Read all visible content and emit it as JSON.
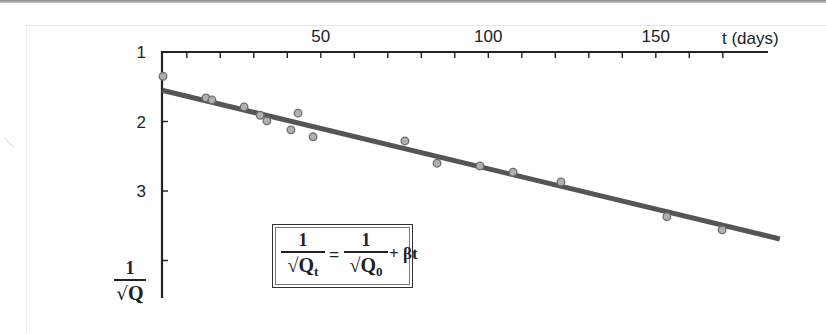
{
  "chart_data": {
    "type": "scatter",
    "title": "",
    "xlabel": "t (days)",
    "ylabel": "1/√Q",
    "x_axis": {
      "position": "top",
      "range": [
        0,
        185
      ],
      "ticks": [
        10,
        20,
        30,
        40,
        50,
        60,
        70,
        80,
        90,
        100,
        110,
        120,
        130,
        140,
        150,
        160,
        170
      ],
      "tick_labels": [
        {
          "value": 50,
          "label": "50"
        },
        {
          "value": 100,
          "label": "100"
        },
        {
          "value": 150,
          "label": "150"
        }
      ]
    },
    "y_axis": {
      "inverted": true,
      "range": [
        1,
        4.2
      ],
      "ticks": [
        1,
        2,
        3,
        4
      ],
      "tick_labels": [
        {
          "value": 1,
          "label": "1"
        },
        {
          "value": 2,
          "label": "2"
        },
        {
          "value": 3,
          "label": "3"
        }
      ]
    },
    "grid": false,
    "legend": null,
    "series": [
      {
        "name": "measurements",
        "kind": "points",
        "x": [
          2.9,
          15.7,
          17.5,
          27.1,
          31.9,
          33.9,
          41.1,
          43.2,
          47.7,
          75.1,
          84.7,
          97.5,
          107.4,
          121.7,
          153.3,
          169.8
        ],
        "y": [
          1.35,
          1.66,
          1.69,
          1.79,
          1.91,
          1.99,
          2.12,
          1.88,
          2.22,
          2.28,
          2.6,
          2.64,
          2.73,
          2.87,
          3.37,
          3.56
        ]
      },
      {
        "name": "linear fit",
        "kind": "line",
        "x": [
          2.6,
          187
        ],
        "y": [
          1.55,
          3.69
        ]
      }
    ],
    "annotations": [
      {
        "text": "1/√Qt = 1/√Q0 + βt",
        "position": "lower-left box"
      }
    ]
  },
  "labels": {
    "x_title": "t (days)",
    "x_ticks": [
      "50",
      "100",
      "150"
    ],
    "y_ticks": [
      "1",
      "2",
      "3"
    ],
    "y_title_num": "1",
    "y_title_den": "Q",
    "formula": {
      "lhs_num": "1",
      "lhs_den": "Q",
      "lhs_sub": "t",
      "eq": "=",
      "rhs_num": "1",
      "rhs_den": "Q",
      "rhs_sub": "0",
      "tail": "+ βt"
    },
    "sqrt_symbol": "√"
  },
  "colors": {
    "axis": "#222222",
    "fit_line": "#555555",
    "point_fill": "#b0b0b0",
    "point_stroke": "#6e6e6e"
  }
}
